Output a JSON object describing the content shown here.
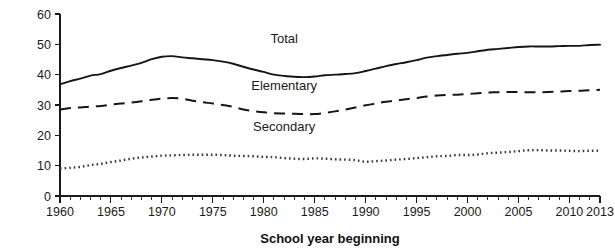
{
  "chart_data": {
    "type": "line",
    "title": "",
    "xlabel": "School year beginning",
    "ylabel": "",
    "xlim": [
      1960,
      2013
    ],
    "ylim": [
      0,
      60
    ],
    "grid": false,
    "legend_position": "inline-annotations",
    "y_ticks": [
      0,
      10,
      20,
      30,
      40,
      50,
      60
    ],
    "y_tick_labels": [
      "0",
      "10",
      "20",
      "30",
      "40",
      "50",
      "60"
    ],
    "x_ticks": [
      1960,
      1965,
      1970,
      1975,
      1980,
      1985,
      1990,
      1995,
      2000,
      2005,
      2010,
      2013
    ],
    "x_tick_labels": [
      "1960",
      "1965",
      "1970",
      "1975",
      "1980",
      "1985",
      "1990",
      "1995",
      "2000",
      "2005",
      "2010",
      "2013"
    ],
    "x_minor_tick_interval": 1,
    "units_note": "millions of students",
    "series": [
      {
        "name": "Total",
        "style": "solid",
        "label_x": 1982,
        "label_y": 50.5,
        "x": [
          1960,
          1961,
          1962,
          1963,
          1964,
          1965,
          1966,
          1967,
          1968,
          1969,
          1970,
          1971,
          1972,
          1973,
          1974,
          1975,
          1976,
          1977,
          1978,
          1979,
          1980,
          1981,
          1982,
          1983,
          1984,
          1985,
          1986,
          1987,
          1988,
          1989,
          1990,
          1991,
          1992,
          1993,
          1994,
          1995,
          1996,
          1997,
          1998,
          1999,
          2000,
          2001,
          2002,
          2003,
          2004,
          2005,
          2006,
          2007,
          2008,
          2009,
          2010,
          2011,
          2012,
          2013
        ],
        "values": [
          36.8,
          37.9,
          38.7,
          39.7,
          40.2,
          41.3,
          42.2,
          43.0,
          43.9,
          45.1,
          45.9,
          46.1,
          45.7,
          45.4,
          45.1,
          44.8,
          44.3,
          43.6,
          42.6,
          41.7,
          40.9,
          40.0,
          39.6,
          39.3,
          39.2,
          39.4,
          39.8,
          40.0,
          40.2,
          40.5,
          41.2,
          42.0,
          42.8,
          43.5,
          44.1,
          44.8,
          45.6,
          46.1,
          46.5,
          46.9,
          47.2,
          47.7,
          48.2,
          48.5,
          48.8,
          49.1,
          49.3,
          49.3,
          49.3,
          49.4,
          49.5,
          49.5,
          49.8,
          49.9
        ]
      },
      {
        "name": "Elementary",
        "style": "dashed",
        "label_x": 1982,
        "label_y": 35.0,
        "x": [
          1960,
          1961,
          1962,
          1963,
          1964,
          1965,
          1966,
          1967,
          1968,
          1969,
          1970,
          1971,
          1972,
          1973,
          1974,
          1975,
          1976,
          1977,
          1978,
          1979,
          1980,
          1981,
          1982,
          1983,
          1984,
          1985,
          1986,
          1987,
          1988,
          1989,
          1990,
          1991,
          1992,
          1993,
          1994,
          1995,
          1996,
          1997,
          1998,
          1999,
          2000,
          2001,
          2002,
          2003,
          2004,
          2005,
          2006,
          2007,
          2008,
          2009,
          2010,
          2011,
          2012,
          2013
        ],
        "values": [
          28.5,
          29.0,
          29.2,
          29.5,
          29.7,
          30.1,
          30.5,
          30.8,
          31.2,
          31.7,
          32.1,
          32.3,
          32.1,
          31.4,
          30.9,
          30.5,
          30.0,
          29.4,
          28.5,
          28.0,
          27.6,
          27.3,
          27.2,
          27.1,
          27.0,
          27.0,
          27.4,
          27.9,
          28.5,
          29.2,
          29.9,
          30.5,
          31.1,
          31.5,
          31.9,
          32.3,
          32.8,
          33.1,
          33.3,
          33.4,
          33.6,
          33.9,
          34.1,
          34.2,
          34.3,
          34.3,
          34.2,
          34.2,
          34.3,
          34.4,
          34.6,
          34.7,
          34.9,
          35.0
        ]
      },
      {
        "name": "Secondary",
        "style": "dotted",
        "label_x": 1982,
        "label_y": 21.5,
        "x": [
          1960,
          1961,
          1962,
          1963,
          1964,
          1965,
          1966,
          1967,
          1968,
          1969,
          1970,
          1971,
          1972,
          1973,
          1974,
          1975,
          1976,
          1977,
          1978,
          1979,
          1980,
          1981,
          1982,
          1983,
          1984,
          1985,
          1986,
          1987,
          1988,
          1989,
          1990,
          1991,
          1992,
          1993,
          1994,
          1995,
          1996,
          1997,
          1998,
          1999,
          2000,
          2001,
          2002,
          2003,
          2004,
          2005,
          2006,
          2007,
          2008,
          2009,
          2010,
          2011,
          2012,
          2013
        ],
        "values": [
          9.0,
          9.3,
          9.6,
          10.2,
          10.6,
          11.2,
          11.7,
          12.3,
          12.7,
          13.0,
          13.3,
          13.4,
          13.5,
          13.6,
          13.6,
          13.6,
          13.5,
          13.3,
          13.2,
          13.1,
          12.9,
          12.8,
          12.5,
          12.3,
          12.2,
          12.4,
          12.3,
          12.1,
          12.0,
          11.8,
          11.3,
          11.5,
          11.7,
          12.0,
          12.2,
          12.5,
          12.8,
          13.1,
          13.2,
          13.5,
          13.5,
          13.7,
          14.1,
          14.3,
          14.5,
          14.8,
          15.1,
          15.1,
          15.0,
          15.0,
          14.9,
          14.8,
          14.9,
          14.9
        ]
      }
    ]
  },
  "axis": {
    "x_title": "School year beginning"
  },
  "labels": {
    "total": "Total",
    "elementary": "Elementary",
    "secondary": "Secondary"
  }
}
